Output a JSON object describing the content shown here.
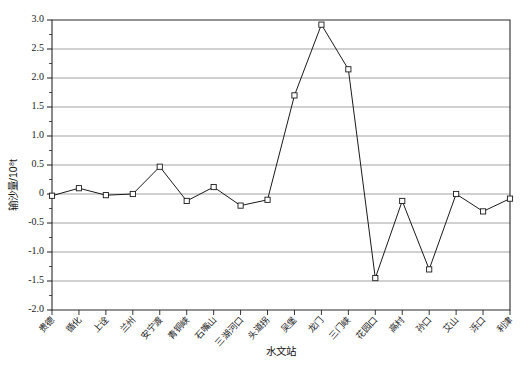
{
  "chart_data": {
    "type": "line",
    "title": "",
    "xlabel": "水文站",
    "ylabel": "输沙量/10⁸t",
    "ylim": [
      -2.0,
      3.0
    ],
    "grid": true,
    "legend": "none",
    "y_ticks": [
      "3.0",
      "2.5",
      "2.0",
      "1.5",
      "1.0",
      "0.5",
      "0",
      "-0.5",
      "-1.0",
      "-1.5",
      "-2.0"
    ],
    "y_tick_values": [
      3.0,
      2.5,
      2.0,
      1.5,
      1.0,
      0.5,
      0,
      -0.5,
      -1.0,
      -1.5,
      -2.0
    ],
    "minor_ticks": true,
    "categories": [
      "贵德",
      "循化",
      "上诠",
      "兰州",
      "安宁渡",
      "青铜峡",
      "石嘴山",
      "三湖河口",
      "头道拐",
      "吴堡",
      "龙门",
      "三门峡",
      "花园口",
      "高村",
      "孙口",
      "艾山",
      "泺口",
      "利津"
    ],
    "series": [
      {
        "name": "输沙量",
        "marker": "open-square",
        "color": "#1a1a1a",
        "values": [
          -0.03,
          0.1,
          -0.02,
          0.0,
          0.47,
          -0.12,
          0.12,
          -0.2,
          -0.1,
          1.7,
          2.92,
          2.15,
          -1.45,
          -0.12,
          -1.3,
          0.0,
          -0.3,
          -0.08
        ]
      }
    ]
  },
  "figure": {
    "plot_left_px": 52,
    "plot_right_px": 510,
    "plot_top_px": 20,
    "plot_bottom_px": 310
  }
}
